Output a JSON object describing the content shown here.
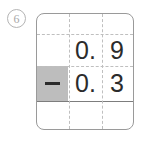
{
  "problem": {
    "number_label": "6",
    "number_icon": "circled-number-marker",
    "type": "vertical-subtraction",
    "operator_symbol": "−",
    "operator_name": "minus-sign",
    "columns": [
      "operator",
      "ones",
      "tenths"
    ],
    "rows": [
      {
        "name": "blank-top-row",
        "cells": [
          "",
          "",
          ""
        ]
      },
      {
        "name": "minuend-row",
        "value": "0.9",
        "cells": [
          "",
          "0.",
          "9"
        ]
      },
      {
        "name": "subtrahend-row",
        "value": "0.3",
        "cells": [
          "−",
          "0.",
          "3"
        ],
        "operator_cell_shaded": true
      },
      {
        "name": "answer-row",
        "value": "",
        "cells": [
          "",
          "",
          ""
        ]
      }
    ]
  },
  "colors": {
    "grid_border": "#9a9a9a",
    "grid_dashed_rule": "#bfbfbf",
    "answer_rule": "#7d7d7d",
    "shaded_cell": "#bdbdbd",
    "digit_text": "#2b2b2b",
    "marker_outline": "#b4b4b4",
    "marker_text": "#a8a8a8",
    "page_background": "#ffffff"
  }
}
